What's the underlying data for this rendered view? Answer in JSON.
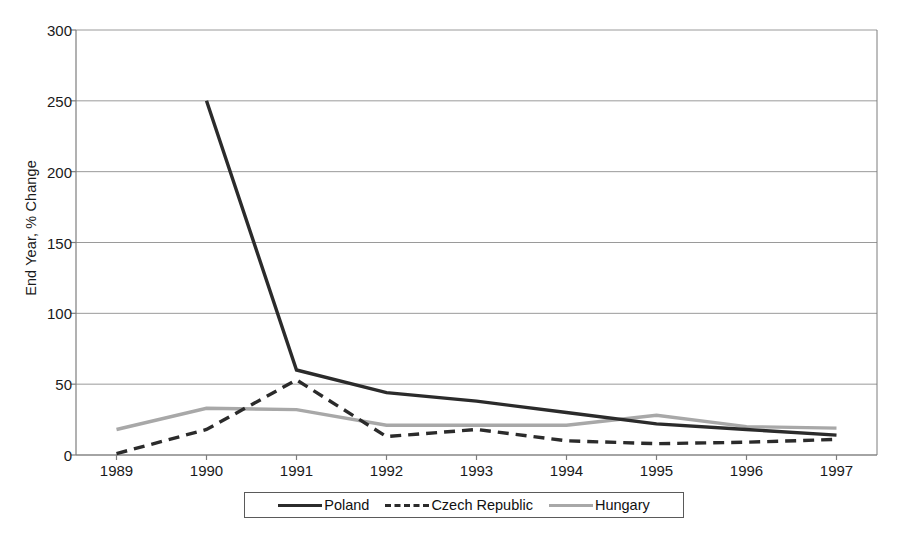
{
  "chart_data": {
    "type": "line",
    "title": "",
    "xlabel": "",
    "ylabel": "End Year, % Change",
    "categories": [
      "1989",
      "1990",
      "1991",
      "1992",
      "1993",
      "1994",
      "1995",
      "1996",
      "1997"
    ],
    "x": [
      1989,
      1990,
      1991,
      1992,
      1993,
      1994,
      1995,
      1996,
      1997
    ],
    "xlim": [
      1988.55,
      1997.45
    ],
    "ylim": [
      0,
      300
    ],
    "ytick_values": [
      0,
      50,
      100,
      150,
      200,
      250,
      300
    ],
    "ytick_labels": [
      "0",
      "50",
      "100",
      "150",
      "200",
      "250",
      "300"
    ],
    "grid": true,
    "grid_axis": "y",
    "legend_position": "bottom",
    "series": [
      {
        "name": "Poland",
        "color": "#2b2b2b",
        "style": "solid",
        "x": [
          1990,
          1991,
          1992,
          1993,
          1994,
          1995,
          1996,
          1997
        ],
        "values": [
          250,
          60,
          44,
          38,
          30,
          22,
          18,
          14
        ]
      },
      {
        "name": "Czech Republic",
        "color": "#2b2b2b",
        "style": "dashed",
        "x": [
          1989,
          1990,
          1991,
          1992,
          1993,
          1994,
          1995,
          1996,
          1997
        ],
        "values": [
          1,
          18,
          53,
          13,
          18,
          10,
          8,
          9,
          11
        ]
      },
      {
        "name": "Hungary",
        "color": "#a8a8a8",
        "style": "solid",
        "x": [
          1989,
          1990,
          1991,
          1992,
          1993,
          1994,
          1995,
          1996,
          1997
        ],
        "values": [
          18,
          33,
          32,
          21,
          21,
          21,
          28,
          20,
          19
        ]
      }
    ]
  },
  "axis": {
    "y_title": "End Year, % Change",
    "y_ticks": [
      "300",
      "250",
      "200",
      "150",
      "100",
      "50",
      "0"
    ],
    "x_ticks": [
      "1989",
      "1990",
      "1991",
      "1992",
      "1993",
      "1994",
      "1995",
      "1996",
      "1997"
    ]
  },
  "legend": {
    "items": [
      {
        "label": "Poland"
      },
      {
        "label": "Czech Republic"
      },
      {
        "label": "Hungary"
      }
    ]
  },
  "colors": {
    "poland": "#2b2b2b",
    "czech": "#2b2b2b",
    "hungary": "#a8a8a8",
    "grid": "#9a9a9a",
    "axis": "#7d7d7d",
    "text": "#1a1a1a"
  }
}
